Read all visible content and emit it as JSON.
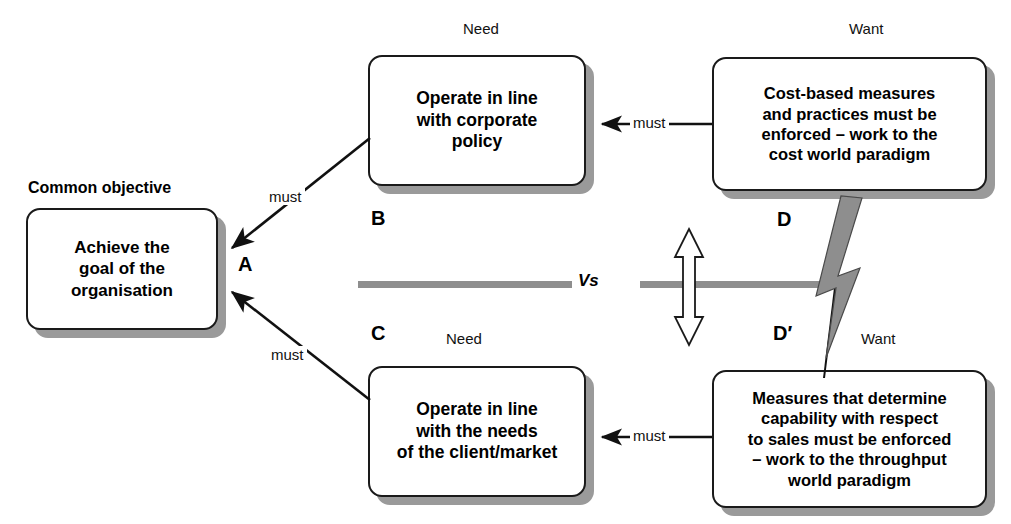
{
  "diagram": {
    "title_label": "Common objective",
    "vs_label": "Vs",
    "captions": {
      "need_top": "Need",
      "want_top": "Want",
      "need_bottom": "Need",
      "want_bottom": "Want"
    },
    "letters": {
      "a": "A",
      "b": "B",
      "c": "C",
      "d": "D",
      "d_prime": "D′"
    },
    "nodes": {
      "objective": {
        "id": "A",
        "text": "Achieve the\ngoal of the\norganisation"
      },
      "need_top": {
        "id": "B",
        "text": "Operate in line\nwith corporate\npolicy"
      },
      "need_bottom": {
        "id": "C",
        "text": "Operate in line\nwith the needs\nof the client/market"
      },
      "want_top": {
        "id": "D",
        "text": "Cost-based measures\nand practices must be\nenforced – work to the\ncost world paradigm"
      },
      "want_bottom": {
        "id": "D′",
        "text": "Measures that determine\ncapability with respect\nto sales must be enforced\n– work to the throughput\nworld paradigm"
      }
    },
    "edges": [
      {
        "name": "b-to-a",
        "label": "must",
        "from": "B",
        "to": "A"
      },
      {
        "name": "c-to-a",
        "label": "must",
        "from": "C",
        "to": "A"
      },
      {
        "name": "d-to-b",
        "label": "must",
        "from": "D",
        "to": "B"
      },
      {
        "name": "dprime-to-c",
        "label": "must",
        "from": "D′",
        "to": "C"
      }
    ],
    "conflict": {
      "name": "conflict-arrow",
      "icon": "double-headed-vertical-arrow",
      "between": [
        "D",
        "D′"
      ],
      "break_icon": "lightning-bolt"
    },
    "colors": {
      "stroke": "#1a1a1a",
      "box_fill": "#ffffff",
      "shadow": "#9a9a9a",
      "divider": "#8e8e8e",
      "bolt": "#8e8e8e",
      "text": "#000000"
    }
  }
}
